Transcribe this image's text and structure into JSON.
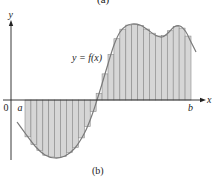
{
  "figure": {
    "caption": "(b)",
    "top_caption_partial": "(a)",
    "function_label": "y = f(x)",
    "axis_labels": {
      "x": "x",
      "y": "y",
      "origin": "0",
      "a": "a",
      "b": "b"
    },
    "colors": {
      "rect_fill": "#d6d6d6",
      "rect_stroke": "#8a8a8a",
      "curve": "#7a7a7a",
      "axis": "#222222"
    },
    "geometry": {
      "origin_px": [
        11,
        100
      ],
      "a_px": 25,
      "b_px": 191,
      "rect_count": 28
    }
  },
  "chart_data": {
    "type": "riemann-sum",
    "title": "",
    "caption": "(b)",
    "curve_label": "y = f(x)",
    "xlabel": "x",
    "ylabel": "y",
    "interval": [
      "a",
      "b"
    ],
    "origin_label": "0",
    "n_rectangles": 28,
    "curve_points_px": [
      [
        17,
        122
      ],
      [
        25,
        133
      ],
      [
        35,
        146
      ],
      [
        45,
        155
      ],
      [
        55,
        158
      ],
      [
        65,
        156
      ],
      [
        75,
        148
      ],
      [
        85,
        132
      ],
      [
        92,
        115
      ],
      [
        97,
        100
      ],
      [
        102,
        84
      ],
      [
        108,
        64
      ],
      [
        114,
        45
      ],
      [
        120,
        32
      ],
      [
        126,
        26
      ],
      [
        132,
        24
      ],
      [
        140,
        25
      ],
      [
        148,
        30
      ],
      [
        155,
        35
      ],
      [
        162,
        37
      ],
      [
        168,
        33
      ],
      [
        174,
        27
      ],
      [
        180,
        26
      ],
      [
        186,
        32
      ],
      [
        191,
        42
      ],
      [
        196,
        52
      ]
    ]
  }
}
